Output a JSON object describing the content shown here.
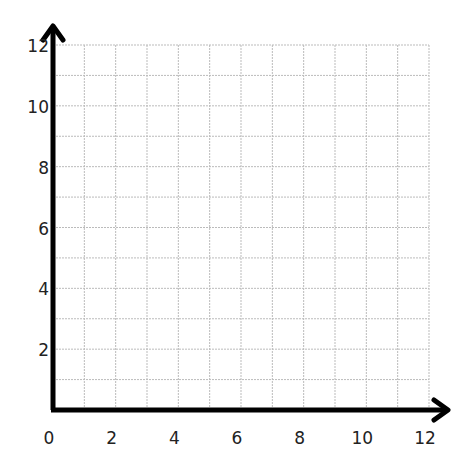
{
  "chart_data": {
    "type": "scatter",
    "title": "",
    "xlabel": "",
    "ylabel": "",
    "xlim": [
      0,
      12
    ],
    "ylim": [
      0,
      12
    ],
    "grid": true,
    "grid_step": 1,
    "x_ticks": [
      "0",
      "2",
      "4",
      "6",
      "8",
      "10",
      "12"
    ],
    "y_ticks": [
      "2",
      "4",
      "6",
      "8",
      "10",
      "12"
    ],
    "series": [],
    "legend": null,
    "axes_arrows": true
  },
  "style": {
    "axis_color": "#000000",
    "grid_color": "#bbbbbb",
    "label_color": "#222222"
  }
}
